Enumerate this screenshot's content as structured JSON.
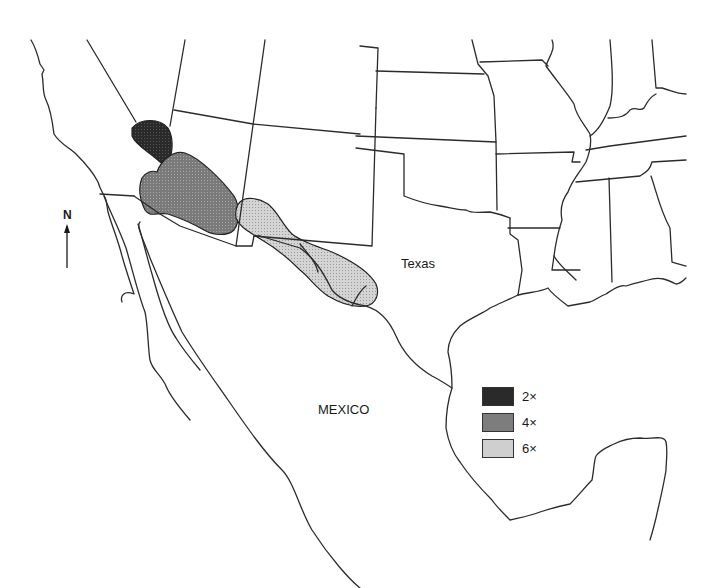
{
  "map": {
    "labels": {
      "texas": "Texas",
      "mexico": "MEXICO",
      "north": "N"
    },
    "legend": {
      "items": [
        {
          "label": "2×",
          "color": "#2a2a2a"
        },
        {
          "label": "4×",
          "color": "#7d7d7d"
        },
        {
          "label": "6×",
          "color": "#cfcfcf"
        }
      ]
    },
    "regions": [
      {
        "name": "2x-region",
        "fill": "#2a2a2a"
      },
      {
        "name": "4x-region",
        "fill": "#7d7d7d"
      },
      {
        "name": "6x-region",
        "fill": "#cfcfcf"
      }
    ]
  }
}
